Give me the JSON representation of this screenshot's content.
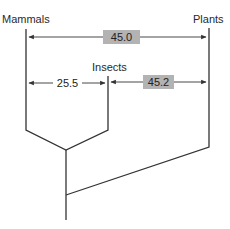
{
  "diagram": {
    "type": "phylogenetic-tree",
    "taxa": [
      {
        "label": "Mammals"
      },
      {
        "label": "Insects"
      },
      {
        "label": "Plants"
      }
    ],
    "distances": [
      {
        "from": "Mammals",
        "to": "Plants",
        "value": "45.0",
        "highlighted": true
      },
      {
        "from": "Mammals",
        "to": "Insects",
        "value": "25.5",
        "highlighted": false
      },
      {
        "from": "Insects",
        "to": "Plants",
        "value": "45.2",
        "highlighted": true
      }
    ],
    "colors": {
      "line": "#333333",
      "highlight_box": "#b3b3b3",
      "background": "#ffffff"
    }
  }
}
